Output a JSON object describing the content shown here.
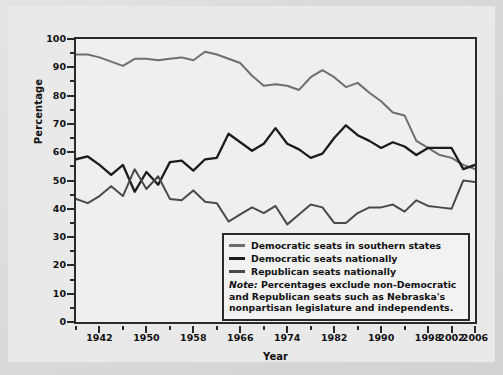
{
  "chart_data": {
    "type": "line",
    "title": "",
    "xlabel": "Year",
    "ylabel": "Percentage",
    "xlim": [
      1938,
      2006
    ],
    "ylim": [
      0,
      100
    ],
    "grid": false,
    "legend_position": "inside-bottom-right",
    "y_ticks_major": [
      0,
      10,
      20,
      30,
      40,
      50,
      60,
      70,
      80,
      90,
      100
    ],
    "y_ticks_minor": [
      5,
      15,
      25,
      35,
      45,
      55,
      65,
      75,
      85,
      95
    ],
    "x_ticks_major": [
      1942,
      1950,
      1958,
      1966,
      1974,
      1982,
      1990,
      1998,
      2002,
      2006
    ],
    "x_ticks_minor": [
      1938,
      1946,
      1954,
      1962,
      1970,
      1978,
      1986,
      1994
    ],
    "x": [
      1938,
      1940,
      1942,
      1944,
      1946,
      1948,
      1950,
      1952,
      1954,
      1956,
      1958,
      1960,
      1962,
      1964,
      1966,
      1968,
      1970,
      1972,
      1974,
      1976,
      1978,
      1980,
      1982,
      1984,
      1986,
      1988,
      1990,
      1992,
      1994,
      1996,
      1998,
      2000,
      2002,
      2004,
      2006
    ],
    "series": [
      {
        "name": "Democratic seats in southern states",
        "color": "#6e6e6e",
        "values": [
          94.5,
          94.5,
          93.5,
          92.0,
          90.5,
          93.0,
          93.0,
          92.5,
          93.0,
          93.5,
          92.5,
          95.5,
          94.5,
          93.0,
          91.5,
          87.0,
          83.5,
          84.0,
          83.5,
          82.0,
          86.5,
          89.0,
          86.5,
          83.0,
          84.5,
          81.0,
          78.0,
          74.0,
          73.0,
          64.0,
          61.5,
          59.0,
          58.0,
          55.5,
          54.0
        ]
      },
      {
        "name": "Democratic seats nationally",
        "color": "#1c1c1c",
        "values": [
          57.5,
          58.5,
          55.5,
          52.0,
          55.5,
          46.0,
          53.0,
          48.5,
          56.5,
          57.0,
          53.5,
          57.5,
          58.0,
          66.5,
          63.5,
          60.5,
          63.0,
          68.5,
          63.0,
          61.0,
          58.0,
          59.5,
          65.0,
          69.5,
          66.0,
          64.0,
          61.5,
          63.5,
          62.0,
          59.0,
          61.5,
          61.5,
          61.5,
          54.0,
          55.5
        ]
      },
      {
        "name": "Republican seats nationally",
        "color": "#4a4a4a",
        "values": [
          43.5,
          42.0,
          44.5,
          48.0,
          44.5,
          54.0,
          47.0,
          51.5,
          43.5,
          43.0,
          46.5,
          42.5,
          42.0,
          35.5,
          38.0,
          40.5,
          38.5,
          41.0,
          34.5,
          38.0,
          41.5,
          40.5,
          35.0,
          35.0,
          38.5,
          40.5,
          40.5,
          41.5,
          39.0,
          43.0,
          41.0,
          40.5,
          40.0,
          50.0,
          49.5
        ]
      }
    ],
    "note_lead": "Note:",
    "note_text": " Percentages exclude non-Democratic and Republican seats such as Nebraska's nonpartisan legislature and independents."
  },
  "axes": {
    "y_title": "Percentage",
    "x_title": "Year"
  }
}
